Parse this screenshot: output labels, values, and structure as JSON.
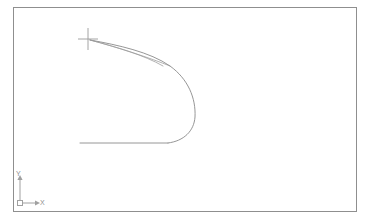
{
  "app": {
    "type": "cad-drawing-viewport",
    "background_color": "#ffffff",
    "frame_color": "#8f8f8f",
    "geometry_color": "#8a8a8a",
    "ucs_color": "#a0a0a0"
  },
  "viewport": {
    "name": "model-space",
    "x": 13,
    "y": 7,
    "width": 344,
    "height": 205
  },
  "cursor": {
    "name": "crosshair-cursor",
    "x": 88,
    "y": 39,
    "arm_half_width": 10,
    "arm_half_height": 11,
    "color": "#9a9a9a"
  },
  "ucs_icon": {
    "label_x": "X",
    "label_y": "Y",
    "origin_x": 20,
    "origin_y": 203,
    "axis_length_x": 20,
    "axis_length_y": 28
  },
  "geometry": {
    "description": "airfoil-like closed profile with sharp leading tip at cursor and rounded trailing bulge",
    "tip_x": 90,
    "tip_y": 40,
    "rightmost_x": 196,
    "bottom_line_y": 143,
    "bottom_line_x_start": 80,
    "bottom_line_x_end": 160,
    "paths": {
      "upper_outer": "M 90 40 C 118 45, 150 52, 170 66 C 188 79, 196 98, 195 117 C 194 131, 184 141, 168 143",
      "upper_inner": "M 90 40 C 116 47, 144 55, 163 66",
      "chord_line": "M 90 40 C 120 48, 150 58, 170 66",
      "lower_line": "M 80 143 L 168 143"
    }
  }
}
